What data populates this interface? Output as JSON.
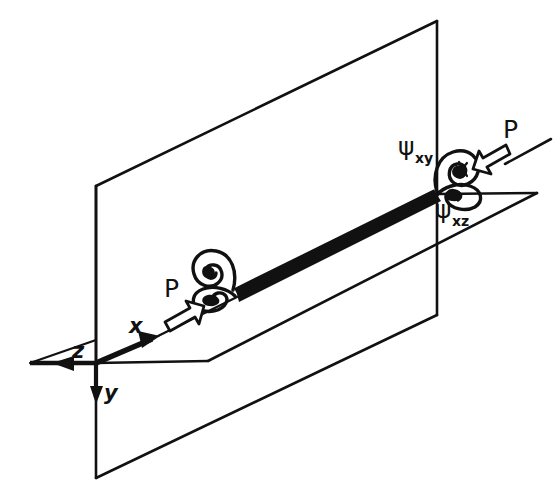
{
  "figure": {
    "background_color": "#ffffff",
    "ink_color": "#111111",
    "bar_color": "#111111"
  },
  "axes": {
    "origin_label": "",
    "items": [
      {
        "name": "x-axis",
        "label": "x",
        "direction": "up-right"
      },
      {
        "name": "y-axis",
        "label": "y",
        "direction": "down"
      },
      {
        "name": "z-axis",
        "label": "z",
        "direction": "left"
      }
    ]
  },
  "planes": [
    {
      "name": "vertical-plane",
      "label": "xy-plane"
    },
    {
      "name": "horizontal-plane",
      "label": "xz-plane"
    }
  ],
  "members": [
    {
      "name": "stiffener-bar",
      "label": "edge bar"
    }
  ],
  "loads": [
    {
      "name": "load-left",
      "label": "P",
      "direction": "up-right"
    },
    {
      "name": "load-right",
      "label": "P",
      "direction": "down-left"
    }
  ],
  "rotations": [
    {
      "name": "psi-xy",
      "symbol": "ψ",
      "subscript": "xy"
    },
    {
      "name": "psi-xz",
      "symbol": "ψ",
      "subscript": "xz"
    }
  ],
  "vortices": [
    {
      "name": "vortex-left-upper",
      "plane": "xy"
    },
    {
      "name": "vortex-left-lower",
      "plane": "xz"
    },
    {
      "name": "vortex-right-upper",
      "plane": "xy"
    },
    {
      "name": "vortex-right-lower",
      "plane": "xz"
    }
  ]
}
